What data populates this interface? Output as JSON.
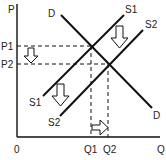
{
  "diagram": {
    "axes": {
      "y_label": "P",
      "x_label": "Q",
      "origin_label": "0"
    },
    "price_labels": {
      "p1": "P1",
      "p2": "P2"
    },
    "quantity_labels": {
      "q1": "Q1",
      "q2": "Q2"
    },
    "curves": {
      "demand_top_label": "D",
      "demand_bottom_label": "D",
      "s1_top_label": "S1",
      "s2_top_label": "S2",
      "s1_bottom_label": "S1",
      "s2_bottom_label": "S2"
    },
    "arrows": [
      {
        "name": "price-decrease-arrow",
        "direction": "down"
      },
      {
        "name": "supply-shift-arrow-upper",
        "direction": "down"
      },
      {
        "name": "supply-shift-arrow-lower",
        "direction": "down"
      },
      {
        "name": "quantity-increase-arrow",
        "direction": "right"
      }
    ],
    "colors": {
      "line": "#111111",
      "arrow_fill": "#ffffff",
      "text": "#222222"
    }
  }
}
